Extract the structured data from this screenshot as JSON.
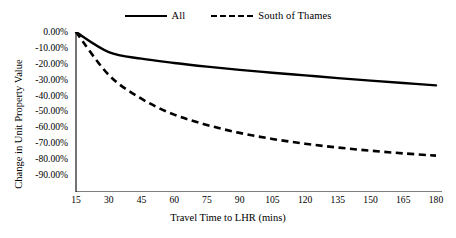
{
  "chart_data": {
    "type": "line",
    "title": "",
    "xlabel": "Travel Time to LHR (mins)",
    "ylabel": "Change in Unit Property Value",
    "xlim": [
      15,
      180
    ],
    "ylim": [
      -90,
      0
    ],
    "grid": false,
    "legend_position": "top-center",
    "x": [
      15,
      30,
      45,
      60,
      75,
      90,
      105,
      120,
      135,
      150,
      165,
      180
    ],
    "xtick_labels": [
      "15",
      "30",
      "45",
      "60",
      "75",
      "90",
      "105",
      "120",
      "135",
      "150",
      "165",
      "180"
    ],
    "ytick_values": [
      0,
      -10,
      -20,
      -30,
      -40,
      -50,
      -60,
      -70,
      -80,
      -90
    ],
    "ytick_labels": [
      "0.00%",
      "-10.00%",
      "-20.00%",
      "-30.00%",
      "-40.00%",
      "-50.00%",
      "-60.00%",
      "-70.00%",
      "-80.00%",
      "-90.00%"
    ],
    "series": [
      {
        "name": "All",
        "style": "solid",
        "color": "#000000",
        "values": [
          0,
          -12.6,
          -16.8,
          -19.5,
          -21.8,
          -23.8,
          -25.6,
          -27.3,
          -29.0,
          -30.6,
          -32.1,
          -33.6
        ]
      },
      {
        "name": "South of Thames",
        "style": "dashed",
        "color": "#000000",
        "values": [
          0,
          -27.0,
          -42.0,
          -52.0,
          -58.5,
          -63.5,
          -67.3,
          -70.3,
          -72.7,
          -74.7,
          -76.4,
          -77.8
        ]
      }
    ]
  },
  "legend": {
    "entries": [
      {
        "label": "All",
        "swatch": "solid-line-swatch"
      },
      {
        "label": "South of Thames",
        "swatch": "dashed-line-swatch"
      }
    ]
  },
  "colors": {
    "background": "#ffffff",
    "axis": "#000000",
    "series_all": "#000000",
    "series_south_of_thames": "#000000"
  }
}
